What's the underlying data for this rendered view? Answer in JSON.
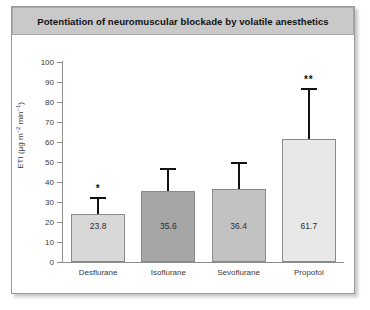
{
  "figure": {
    "title": "Potentiation of neuromuscular blockade by volatile anesthetics"
  },
  "axis": {
    "y_title_text": "ETI (µg m",
    "y_title_sup1": "−2",
    "y_title_mid": " min",
    "y_title_sup2": "−1",
    "y_title_end": ")",
    "y_title_plain": "ETI (µg m−2 min−1)"
  },
  "chart_data": {
    "type": "bar",
    "title": "Potentiation of neuromuscular blockade by volatile anesthetics",
    "xlabel": "",
    "ylabel": "ETI (µg m−2 min−1)",
    "ylim": [
      0,
      100
    ],
    "yticks": [
      0,
      10,
      20,
      30,
      40,
      50,
      60,
      70,
      80,
      90,
      100
    ],
    "ytick_labels": [
      "0",
      "10",
      "20",
      "30",
      "40",
      "50",
      "60",
      "70",
      "80",
      "90",
      "100"
    ],
    "grid": false,
    "legend": "none",
    "categories": [
      "Desflurane",
      "Isoflurane",
      "Sevoflurane",
      "Propofol"
    ],
    "values": [
      23.8,
      35.6,
      36.4,
      61.7
    ],
    "value_labels": [
      "23.8",
      "35.6",
      "36.4",
      "61.7"
    ],
    "errors_upper": [
      8.7,
      11.5,
      13.6,
      25.3
    ],
    "error_tops": [
      32.5,
      47.1,
      50.0,
      87.0
    ],
    "significance": [
      "*",
      "",
      "",
      "**"
    ],
    "bar_colors": [
      "#d8d8d8",
      "#a6a6a6",
      "#c2c2c2",
      "#e8e8e8"
    ],
    "bar_edge_color": "#8a8a8a"
  },
  "colors": {
    "title_bar_bg": "#c9c9c9",
    "frame_border": "#9a9a9a",
    "axis": "#8d8d8d",
    "text": "#3a3a3a",
    "error_bar": "#111111"
  }
}
